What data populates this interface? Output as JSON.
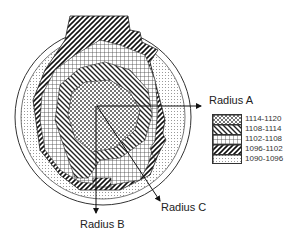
{
  "labels": {
    "radius_a": "Radius A",
    "radius_b": "Radius B",
    "radius_c": "Radius C"
  },
  "legend": {
    "items": [
      {
        "label": "1114-1120",
        "pattern": "checker"
      },
      {
        "label": "1108-1114",
        "pattern": "diag-back"
      },
      {
        "label": "1102-1108",
        "pattern": "grid"
      },
      {
        "label": "1096-1102",
        "pattern": "diag-forward"
      },
      {
        "label": "1090-1096",
        "pattern": "dots"
      }
    ]
  },
  "colors": {
    "line": "#222222",
    "background": "#ffffff"
  }
}
